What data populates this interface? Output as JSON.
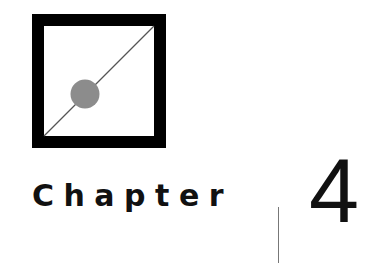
{
  "logo": {
    "icon": "square-diagonal-dot-icon",
    "frame_color": "#000000",
    "dot_color": "#8c8c8c",
    "line_color": "#555555"
  },
  "chapter": {
    "label": "Chapter",
    "number": "4"
  }
}
